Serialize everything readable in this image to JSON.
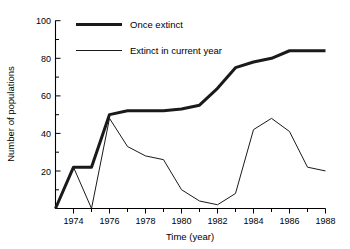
{
  "chart_data": {
    "type": "line",
    "title": "",
    "xlabel": "Time (year)",
    "ylabel": "Number of populations",
    "xlim": [
      1973,
      1988
    ],
    "ylim": [
      0,
      100
    ],
    "yticks": [
      0,
      20,
      40,
      60,
      80,
      100
    ],
    "ytick_labels": [
      "",
      "20",
      "40",
      "60",
      "80",
      "100"
    ],
    "yminor_ticks": [
      10,
      30,
      50,
      70,
      90
    ],
    "xticks": [
      1974,
      1976,
      1978,
      1980,
      1982,
      1984,
      1986,
      1988
    ],
    "xtick_labels": [
      "1974",
      "1976",
      "1978",
      "1980",
      "1982",
      "1984",
      "1986",
      "1988"
    ],
    "xminor_ticks": [
      1975,
      1977,
      1979,
      1981,
      1983,
      1985,
      1987
    ],
    "grid": false,
    "legend_position": "top-center",
    "x": [
      1973,
      1974,
      1975,
      1976,
      1977,
      1978,
      1979,
      1980,
      1981,
      1982,
      1983,
      1984,
      1985,
      1986,
      1987,
      1988
    ],
    "series": [
      {
        "name": "Once extinct",
        "color": "#1a1a1a",
        "line_width": "thick",
        "values": [
          0,
          22,
          22,
          50,
          52,
          52,
          52,
          53,
          55,
          64,
          75,
          78,
          80,
          84,
          84,
          84
        ]
      },
      {
        "name": "Extinct in current year",
        "color": "#1a1a1a",
        "line_width": "thin",
        "values": [
          0,
          22,
          0,
          48,
          33,
          28,
          26,
          10,
          4,
          2,
          8,
          42,
          48,
          41,
          22,
          20
        ]
      }
    ]
  },
  "legend": {
    "entries": [
      {
        "label": "Once extinct"
      },
      {
        "label": "Extinct in current year"
      }
    ]
  },
  "axes": {
    "y_title": "Number of populations",
    "x_title": "Time (year)"
  }
}
